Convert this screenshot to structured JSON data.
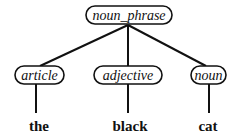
{
  "diagram": {
    "type": "parse-tree",
    "root": {
      "label": "noun_phrase"
    },
    "children": [
      {
        "label": "article",
        "leaf": "the"
      },
      {
        "label": "adjective",
        "leaf": "black"
      },
      {
        "label": "noun",
        "leaf": "cat"
      }
    ]
  }
}
